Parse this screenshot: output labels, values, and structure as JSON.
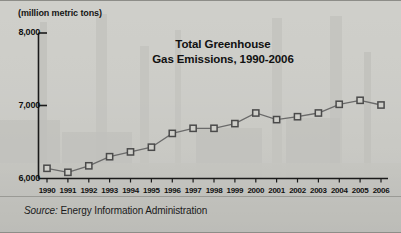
{
  "figure": {
    "units_label": "(million metric tons)",
    "title_line1": "Total Greenhouse",
    "title_line2": "Gas Emissions, 1990-2006",
    "source_prefix": "Source:",
    "source_text": " Energy Information Administration",
    "background": "faded photograph of industrial smokestacks / refinery",
    "colors": {
      "background": "#c9c9c4",
      "marker_stroke": "#4a4a4a",
      "marker_fill": "#cfcfca",
      "line": "#6a6a6a",
      "axis": "#1a1a1a",
      "text": "#111111"
    }
  },
  "chart_data": {
    "type": "line",
    "title": "Total Greenhouse Gas Emissions, 1990-2006",
    "xlabel": "",
    "ylabel": "(million metric tons)",
    "ylim": [
      6000,
      8000
    ],
    "yticks": [
      6000,
      7000,
      8000
    ],
    "ytick_labels": [
      "6,000",
      "7,000",
      "8,000"
    ],
    "grid": false,
    "legend": false,
    "marker": "square",
    "categories": [
      "1990",
      "1991",
      "1992",
      "1993",
      "1994",
      "1995",
      "1996",
      "1997",
      "1998",
      "1999",
      "2000",
      "2001",
      "2002",
      "2003",
      "2004",
      "2005",
      "2006"
    ],
    "values": [
      6140,
      6085,
      6175,
      6300,
      6365,
      6430,
      6620,
      6690,
      6690,
      6755,
      6900,
      6810,
      6850,
      6900,
      7020,
      7075,
      7010
    ],
    "series": [
      {
        "name": "Total greenhouse gas emissions",
        "values": [
          6140,
          6085,
          6175,
          6300,
          6365,
          6430,
          6620,
          6690,
          6690,
          6755,
          6900,
          6810,
          6850,
          6900,
          7020,
          7075,
          7010
        ]
      }
    ],
    "annotations": [
      "Source: Energy Information Administration"
    ]
  }
}
